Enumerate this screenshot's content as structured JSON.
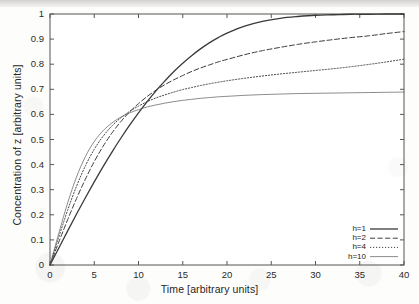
{
  "chart_data": {
    "type": "line",
    "title": "",
    "xlabel": "Time [arbitrary units]",
    "ylabel": "Concentration of z [arbitrary units]",
    "xlim": [
      0,
      40
    ],
    "ylim": [
      0,
      1
    ],
    "xticks": [
      "0",
      "5",
      "10",
      "15",
      "20",
      "25",
      "30",
      "35",
      "40"
    ],
    "xtick_values": [
      0,
      5,
      10,
      15,
      20,
      25,
      30,
      35,
      40
    ],
    "yticks": [
      "0",
      "0.1",
      "0.2",
      "0.3",
      "0.4",
      "0.5",
      "0.6",
      "0.7",
      "0.8",
      "0.9",
      "1"
    ],
    "ytick_values": [
      0,
      0.1,
      0.2,
      0.3,
      0.4,
      0.5,
      0.6,
      0.7,
      0.8,
      0.9,
      1
    ],
    "grid": false,
    "legend_position": "lower right",
    "x": [
      0,
      1,
      2,
      3,
      4,
      5,
      6,
      7,
      8,
      9,
      10,
      11,
      12,
      13,
      14,
      15,
      16,
      17,
      18,
      19,
      20,
      22,
      24,
      26,
      28,
      30,
      32,
      34,
      36,
      38,
      40
    ],
    "series": [
      {
        "name": "h=1",
        "label": "h=1",
        "style": "solid",
        "width": 1.3,
        "color": "#3a3a3a",
        "values": [
          0,
          0.068,
          0.136,
          0.203,
          0.268,
          0.331,
          0.392,
          0.45,
          0.505,
          0.557,
          0.606,
          0.652,
          0.695,
          0.734,
          0.771,
          0.804,
          0.834,
          0.861,
          0.885,
          0.906,
          0.924,
          0.952,
          0.971,
          0.983,
          0.99,
          0.995,
          0.997,
          0.999,
          0.999,
          1.0,
          1.0
        ]
      },
      {
        "name": "h=2",
        "label": "h=2",
        "style": "dashed",
        "width": 1.0,
        "color": "#3d3d3d",
        "values": [
          0,
          0.092,
          0.181,
          0.265,
          0.342,
          0.412,
          0.473,
          0.526,
          0.571,
          0.61,
          0.643,
          0.672,
          0.697,
          0.719,
          0.738,
          0.755,
          0.771,
          0.785,
          0.797,
          0.809,
          0.819,
          0.838,
          0.854,
          0.867,
          0.879,
          0.889,
          0.898,
          0.906,
          0.913,
          0.922,
          0.93
        ]
      },
      {
        "name": "h=4",
        "label": "h=4",
        "style": "dotted",
        "width": 1.0,
        "color": "#454545",
        "values": [
          0,
          0.112,
          0.219,
          0.314,
          0.395,
          0.461,
          0.513,
          0.554,
          0.586,
          0.612,
          0.633,
          0.651,
          0.666,
          0.678,
          0.689,
          0.699,
          0.707,
          0.715,
          0.722,
          0.728,
          0.734,
          0.744,
          0.753,
          0.761,
          0.768,
          0.775,
          0.782,
          0.79,
          0.799,
          0.809,
          0.82
        ]
      },
      {
        "name": "h=10",
        "label": "h=10",
        "style": "solid-thin",
        "width": 0.7,
        "color": "#5a5a5a",
        "values": [
          0,
          0.127,
          0.248,
          0.351,
          0.432,
          0.492,
          0.535,
          0.566,
          0.589,
          0.606,
          0.619,
          0.63,
          0.638,
          0.645,
          0.651,
          0.656,
          0.66,
          0.664,
          0.667,
          0.67,
          0.672,
          0.676,
          0.679,
          0.681,
          0.683,
          0.684,
          0.685,
          0.686,
          0.687,
          0.688,
          0.689
        ]
      }
    ]
  },
  "legend": {
    "entries": [
      {
        "label": "h=1"
      },
      {
        "label": "h=2"
      },
      {
        "label": "h=4"
      },
      {
        "label": "h=10"
      }
    ]
  }
}
